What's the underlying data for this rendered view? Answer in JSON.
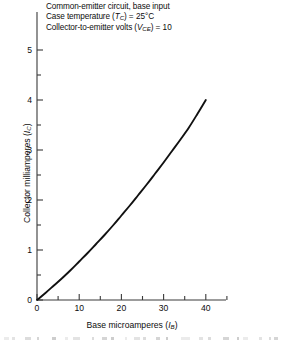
{
  "chart_data": {
    "type": "line",
    "title": "",
    "subtitle": "",
    "xlabel": "Base microamperes (I_B)",
    "ylabel": "Collector milliamperes (I_C)",
    "xlabel_main": "Base microamperes",
    "xlabel_symbol": "I",
    "xlabel_subscript": "B",
    "ylabel_main": "Collector milliamperes",
    "ylabel_symbol": "I",
    "ylabel_subscript": "C",
    "xlim": [
      0,
      45
    ],
    "ylim": [
      0,
      5.4
    ],
    "xticks": [
      0,
      10,
      20,
      30,
      40
    ],
    "yticks": [
      0,
      1,
      2,
      3,
      4,
      5
    ],
    "x_minor_tick_interval": 5,
    "y_minor_tick_interval": 0.5,
    "xticklabels": [
      "0",
      "10",
      "20",
      "30",
      "40"
    ],
    "yticklabels": [
      "0",
      "1",
      "2",
      "3",
      "4",
      "5"
    ],
    "grid": false,
    "legend": null,
    "series": [
      {
        "name": "collector current vs base current",
        "x": [
          0,
          2,
          4,
          6,
          8,
          10,
          12,
          14,
          16,
          18,
          20,
          22,
          24,
          26,
          28,
          30,
          32,
          34,
          36,
          38,
          40
        ],
        "values": [
          0,
          0.14,
          0.29,
          0.44,
          0.6,
          0.77,
          0.94,
          1.12,
          1.3,
          1.49,
          1.69,
          1.89,
          2.1,
          2.31,
          2.53,
          2.75,
          2.98,
          3.21,
          3.45,
          3.72,
          4.0
        ]
      }
    ],
    "curve_color": "#111111",
    "axis_color": "#3a3a3a",
    "annotations": [
      {
        "text_full": "Common-emitter circuit, base input",
        "text": "Common-emitter circuit, base input"
      },
      {
        "text_full": "Case temperature (T_C) = 25°C",
        "prefix": "Case temperature (",
        "symbol": "T",
        "subscript": "C",
        "suffix": ") = 25°C",
        "value": "25",
        "unit": "°C"
      },
      {
        "text_full": "Collector-to-emitter volts (V_CE) = 10",
        "prefix": "Collector-to-emitter volts (",
        "symbol": "V",
        "subscript": "CE",
        "suffix": ") = 10",
        "value": "10",
        "unit": ""
      }
    ]
  },
  "annotation": {
    "line1": "Common-emitter circuit, base input",
    "line2_prefix": "Case temperature (",
    "line2_symbol": "T",
    "line2_sub": "C",
    "line2_suffix": ") ",
    "line2_eq": "= 25°C",
    "line3_prefix": "Collector-to-emitter volts (",
    "line3_symbol": "V",
    "line3_sub": "CE",
    "line3_suffix": ") ",
    "line3_eq": "= 10"
  },
  "axes": {
    "y_label_text": "Collector milliamperes (",
    "y_label_symbol": "I",
    "y_label_sub": "C",
    "y_label_close": ")",
    "x_label_text": "Base microamperes (",
    "x_label_symbol": "I",
    "x_label_sub": "B",
    "x_label_close": ")"
  }
}
